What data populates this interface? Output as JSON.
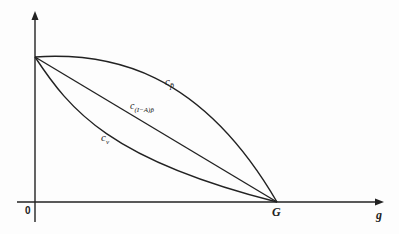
{
  "diagram": {
    "axes": {
      "origin_label": "0",
      "x_axis_label": "g",
      "x_intercept_label": "G"
    },
    "curves": [
      {
        "id": "c-p-bar",
        "label": "c",
        "subscript": "p̄",
        "shape": "concave"
      },
      {
        "id": "c-i-minus-a-p-bar",
        "label": "c",
        "subscript": "(I−A)p̄",
        "shape": "linear"
      },
      {
        "id": "c-v",
        "label": "c",
        "subscript": "v",
        "shape": "convex"
      }
    ],
    "colors": {
      "line": "#222222",
      "background": "#fdfdfd"
    }
  }
}
